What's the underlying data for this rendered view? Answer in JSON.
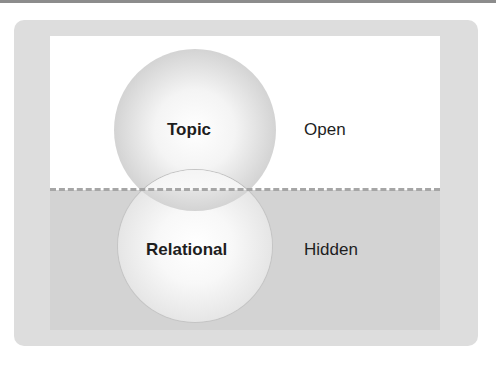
{
  "diagram": {
    "type": "two-region layered circles",
    "regions": [
      {
        "id": "open",
        "label": "Open",
        "fill": "#ffffff"
      },
      {
        "id": "hidden",
        "label": "Hidden",
        "fill": "#d3d3d3"
      }
    ],
    "circles": [
      {
        "id": "topic",
        "label": "Topic",
        "region": "open"
      },
      {
        "id": "relational",
        "label": "Relational",
        "region": "hidden"
      }
    ],
    "separator": {
      "style": "dashed",
      "color": "#a6a6a6"
    },
    "frame_color": "#dddddd"
  }
}
